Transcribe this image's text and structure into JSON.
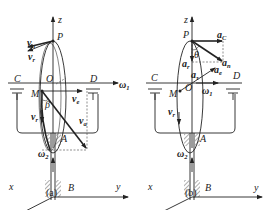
{
  "figure": {
    "panels": [
      {
        "id": "a",
        "caption": "(a)",
        "points": {
          "P": "P",
          "O": "O",
          "M": "M",
          "C": "C",
          "D": "D",
          "A": "A",
          "B": "B"
        },
        "axes": {
          "z": "z",
          "x": "x",
          "y": "y"
        },
        "angles": {
          "beta": "β"
        },
        "vectors": {
          "vn": {
            "main": "v",
            "sub": "n"
          },
          "vr_top": {
            "main": "v",
            "sub": "r"
          },
          "ve": {
            "main": "v",
            "sub": "e"
          },
          "vr_bottom": {
            "main": "v",
            "sub": "r"
          },
          "va": {
            "main": "v",
            "sub": "a"
          },
          "omega1": {
            "main": "ω",
            "sub": "1"
          },
          "omega2": {
            "main": "ω",
            "sub": "2"
          }
        }
      },
      {
        "id": "b",
        "caption": "(b)",
        "points": {
          "P": "P",
          "O": "O",
          "M": "M",
          "C": "C",
          "D": "D",
          "A": "A",
          "B": "B"
        },
        "axes": {
          "z": "z",
          "x": "x",
          "y": "y"
        },
        "angles": {
          "theta": "θ"
        },
        "vectors": {
          "aC": {
            "main": "a",
            "sub": "C"
          },
          "ar": {
            "main": "a",
            "sub": "r"
          },
          "an": {
            "main": "a",
            "sub": "n"
          },
          "at": {
            "main": "a",
            "sub": "τ"
          },
          "ae": {
            "main": "a",
            "sub": "e"
          },
          "omega1": {
            "main": "ω",
            "sub": "1"
          },
          "omega2": {
            "main": "ω",
            "sub": "2"
          },
          "vr": {
            "main": "v",
            "sub": "r"
          }
        }
      }
    ]
  }
}
